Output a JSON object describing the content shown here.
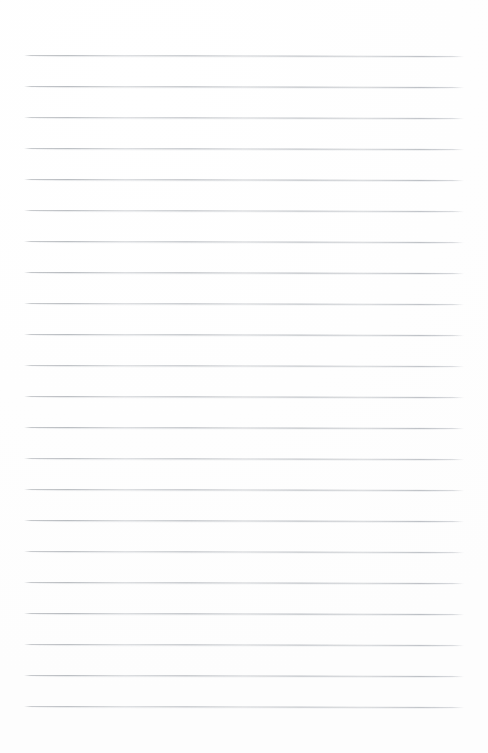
{
  "document": {
    "kind": "lined-paper-page",
    "title": "",
    "body_text": "",
    "page_width": 488,
    "page_height": 753,
    "background_color": "#ffffff",
    "has_text": false,
    "has_margin_rule": false,
    "has_header": false,
    "has_page_number": false
  },
  "ruling": {
    "line_color": "#b9bcc0",
    "line_thickness_px": 1,
    "line_count": 22,
    "first_line_y": 55,
    "last_line_y": 706,
    "line_spacing_px": 31.0,
    "left_margin_px": 24,
    "right_margin_px": 24,
    "line_length_px": 440,
    "slant_degrees": 0.12,
    "lines": [
      {
        "index": 1,
        "y": 55,
        "x_start": 24,
        "x_end": 464
      },
      {
        "index": 2,
        "y": 86,
        "x_start": 24,
        "x_end": 464
      },
      {
        "index": 3,
        "y": 117,
        "x_start": 24,
        "x_end": 464
      },
      {
        "index": 4,
        "y": 148,
        "x_start": 24,
        "x_end": 464
      },
      {
        "index": 5,
        "y": 179,
        "x_start": 24,
        "x_end": 464
      },
      {
        "index": 6,
        "y": 210,
        "x_start": 24,
        "x_end": 464
      },
      {
        "index": 7,
        "y": 241,
        "x_start": 24,
        "x_end": 464
      },
      {
        "index": 8,
        "y": 272,
        "x_start": 24,
        "x_end": 464
      },
      {
        "index": 9,
        "y": 303,
        "x_start": 24,
        "x_end": 464
      },
      {
        "index": 10,
        "y": 334,
        "x_start": 24,
        "x_end": 464
      },
      {
        "index": 11,
        "y": 365,
        "x_start": 24,
        "x_end": 464
      },
      {
        "index": 12,
        "y": 396,
        "x_start": 24,
        "x_end": 464
      },
      {
        "index": 13,
        "y": 427,
        "x_start": 24,
        "x_end": 464
      },
      {
        "index": 14,
        "y": 458,
        "x_start": 24,
        "x_end": 464
      },
      {
        "index": 15,
        "y": 489,
        "x_start": 24,
        "x_end": 464
      },
      {
        "index": 16,
        "y": 520,
        "x_start": 24,
        "x_end": 464
      },
      {
        "index": 17,
        "y": 551,
        "x_start": 24,
        "x_end": 464
      },
      {
        "index": 18,
        "y": 582,
        "x_start": 24,
        "x_end": 464
      },
      {
        "index": 19,
        "y": 613,
        "x_start": 24,
        "x_end": 464
      },
      {
        "index": 20,
        "y": 644,
        "x_start": 24,
        "x_end": 464
      },
      {
        "index": 21,
        "y": 675,
        "x_start": 24,
        "x_end": 464
      },
      {
        "index": 22,
        "y": 706,
        "x_start": 24,
        "x_end": 464
      }
    ]
  }
}
